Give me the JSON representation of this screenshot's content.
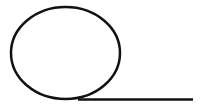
{
  "diagram": {
    "width": 201,
    "height": 106,
    "background": "#ffffff",
    "stroke_color": "#111111",
    "shapes": [
      {
        "type": "ellipse",
        "name": "loop-ellipse",
        "cx": 65.5,
        "cy": 53,
        "rx": 54.5,
        "ry": 46,
        "stroke_width": 2.5
      },
      {
        "type": "line",
        "name": "tangent-line",
        "x1": 78,
        "y1": 99.5,
        "x2": 193,
        "y2": 99.5,
        "stroke_width": 2.5
      }
    ]
  }
}
